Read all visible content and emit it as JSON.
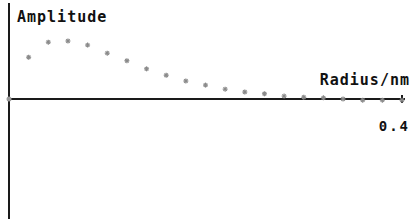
{
  "chart_data": {
    "type": "scatter",
    "title": "",
    "xlabel": "Radius/nm",
    "ylabel": "Amplitude",
    "xlim": [
      0,
      0.4
    ],
    "ylim": [
      -1.0,
      1.0
    ],
    "x_ticks": [
      {
        "value": 0.4,
        "label": "0.4"
      }
    ],
    "y_ticks": [],
    "grid": false,
    "legend": null,
    "marker": "asterisk",
    "marker_color": "#8a8a8a",
    "series": [
      {
        "name": "Amplitude",
        "x": [
          0.02,
          0.04,
          0.06,
          0.08,
          0.1,
          0.12,
          0.14,
          0.16,
          0.18,
          0.2,
          0.22,
          0.24,
          0.26,
          0.28,
          0.3,
          0.32,
          0.34,
          0.36,
          0.38,
          0.4
        ],
        "y": [
          0.72,
          0.98,
          1.0,
          0.93,
          0.79,
          0.66,
          0.52,
          0.41,
          0.31,
          0.24,
          0.17,
          0.12,
          0.09,
          0.05,
          0.03,
          0.02,
          0.0,
          -0.02,
          -0.02,
          -0.02
        ]
      }
    ]
  }
}
